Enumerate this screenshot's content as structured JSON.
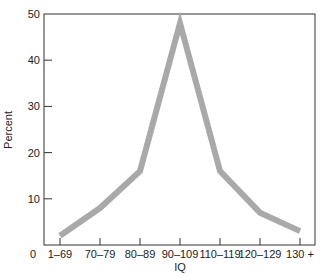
{
  "chart_data": {
    "type": "line",
    "title": "",
    "xlabel": "IQ",
    "ylabel": "Percent",
    "categories": [
      "1–69",
      "70–79",
      "80–89",
      "90–109",
      "110–119",
      "120–129",
      "130 +"
    ],
    "series": [
      {
        "name": "Percent",
        "values": [
          2,
          8,
          16,
          48,
          16,
          7,
          3
        ],
        "color": "#a9a9a9"
      }
    ],
    "ylim": [
      0,
      50
    ],
    "yticks": [
      "0",
      "10",
      "20",
      "30",
      "40",
      "50"
    ],
    "grid": false,
    "legend": null
  }
}
